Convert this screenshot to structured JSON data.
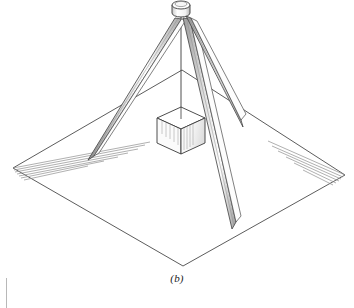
{
  "figure": {
    "caption": "(b)",
    "projection": "isometric-line-drawing",
    "colors": {
      "background": "#ffffff",
      "line": "#3a3a3a",
      "line_light": "#6e6e6e",
      "hatch": "#8a8a8a",
      "shade": "#9a9a9a",
      "rule": "#b8b8b8"
    },
    "geometry": {
      "apex": {
        "x": 181,
        "y": 10
      },
      "collar": {
        "cx": 181,
        "cy": 8,
        "rx": 9,
        "ry": 4,
        "height": 10
      },
      "cable": {
        "x1": 181,
        "y1": 14,
        "x2": 181,
        "y2": 118
      },
      "ground_plane": {
        "top": {
          "x": 182,
          "y": 70
        },
        "right": {
          "x": 345,
          "y": 175
        },
        "bottom": {
          "x": 183,
          "y": 266
        },
        "left": {
          "x": 13,
          "y": 168
        }
      },
      "block": {
        "center_top": {
          "x": 181,
          "y": 118
        },
        "half_width": 24,
        "top_rise": 11,
        "side_height": 25
      },
      "legs": [
        {
          "name": "leg-front-left",
          "tip": {
            "x": 88,
            "y": 160
          },
          "width": 7
        },
        {
          "name": "leg-front-right",
          "tip": {
            "x": 232,
            "y": 228
          },
          "width": 8
        },
        {
          "name": "leg-back-right",
          "tip": {
            "x": 243,
            "y": 126
          },
          "width": 7
        }
      ],
      "hatch": {
        "left_corner_lines": 6,
        "right_corner_lines": 6
      }
    }
  }
}
